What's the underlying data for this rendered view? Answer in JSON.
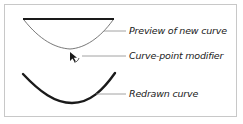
{
  "diagram": {
    "labels": {
      "preview": "Preview of new curve",
      "modifier": "Curve-point modifier",
      "redrawn": "Redrawn curve"
    },
    "icons": {
      "cursor": "curve-point-modifier-cursor"
    },
    "colors": {
      "stroke": "#1a1a1a",
      "leader": "#8a8a8a",
      "border": "#c8c8c8"
    }
  }
}
